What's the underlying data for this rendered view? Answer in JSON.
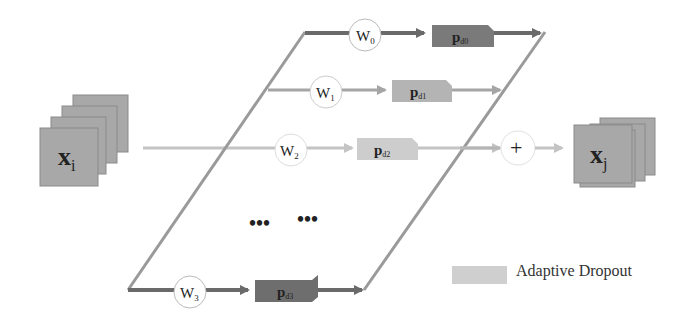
{
  "input": {
    "label": "x",
    "subscript": "i"
  },
  "output": {
    "label": "x",
    "subscript": "j"
  },
  "branches": [
    {
      "weight": "W",
      "weight_sub": "0",
      "dropout": "p",
      "dropout_sub": "d0",
      "shade": "#7a7a7a"
    },
    {
      "weight": "W",
      "weight_sub": "1",
      "dropout": "p",
      "dropout_sub": "d1",
      "shade": "#b4b4b4"
    },
    {
      "weight": "W",
      "weight_sub": "2",
      "dropout": "p",
      "dropout_sub": "d2",
      "shade": "#cdcdcd"
    },
    {
      "weight": "W",
      "weight_sub": "3",
      "dropout": "p",
      "dropout_sub": "d3",
      "shade": "#6e6e6e"
    }
  ],
  "ellipsis": [
    "•••",
    "•••"
  ],
  "sum": {
    "symbol": "+"
  },
  "legend": {
    "label": "Adaptive Dropout",
    "swatch_color": "#cfcfcf"
  },
  "colors": {
    "dark": "#6a6a6a",
    "medium": "#9e9e9e",
    "light": "#c4c4c4",
    "stack": "#a8a8a8"
  }
}
